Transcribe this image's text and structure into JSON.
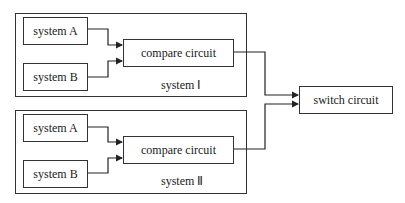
{
  "groups": [
    {
      "label": "system Ⅰ",
      "blocks": {
        "a": "system A",
        "b": "system B",
        "compare": "compare circuit"
      }
    },
    {
      "label": "system Ⅱ",
      "blocks": {
        "a": "system A",
        "b": "system B",
        "compare": "compare circuit"
      }
    }
  ],
  "output": {
    "label": "switch circuit"
  }
}
